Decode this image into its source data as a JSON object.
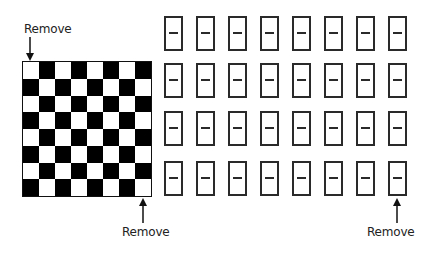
{
  "labels": {
    "top_left": "Remove",
    "bottom_board": "Remove",
    "bottom_dominoes": "Remove"
  },
  "board": {
    "rows": 8,
    "cols": 8,
    "top_left_color": "white",
    "colors": {
      "light": "#ffffff",
      "dark": "#000000"
    }
  },
  "dominoes": {
    "rows": 4,
    "cols": 8,
    "count": 32,
    "col_x": [
      164,
      196,
      228,
      260,
      292,
      324,
      356,
      388
    ],
    "row_y": [
      16,
      63,
      111,
      161
    ]
  }
}
